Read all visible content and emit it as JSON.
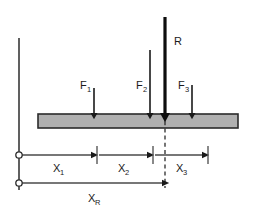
{
  "diagram": {
    "colors": {
      "beam_fill": "#b0b0b0",
      "beam_stroke": "#2b2b2b",
      "line": "#4a4a4a",
      "arrow": "#1a1a1a",
      "resultant": "#0d0d0d",
      "dashed": "#2b2b2b",
      "text": "#1a1a1a",
      "background": "#ffffff"
    },
    "forces": [
      {
        "id": "f1",
        "label": "F",
        "subscript": "1",
        "x": 94,
        "arrow_top": 88,
        "arrow_bottom": 114,
        "label_x": 80,
        "label_y": 89,
        "width": 1.6
      },
      {
        "id": "f2",
        "label": "F",
        "subscript": "2",
        "x": 150,
        "arrow_top": 50,
        "arrow_bottom": 114,
        "label_x": 136,
        "label_y": 89,
        "width": 1.6
      },
      {
        "id": "f3",
        "label": "F",
        "subscript": "3",
        "x": 192,
        "arrow_top": 85,
        "arrow_bottom": 114,
        "label_x": 178,
        "label_y": 89,
        "width": 1.6
      }
    ],
    "resultant": {
      "id": "r",
      "label": "R",
      "subscript": "",
      "x": 165,
      "arrow_top": 17,
      "arrow_bottom": 114,
      "label_x": 174,
      "label_y": 45,
      "width": 3.2
    },
    "beam": {
      "x": 38,
      "y": 114,
      "width": 200,
      "height": 14
    },
    "datum_line": {
      "x": 19,
      "y_top": 38,
      "y_bottom": 190
    },
    "dashed_line": {
      "x": 165,
      "y_top": 114,
      "y_bottom": 188
    },
    "dimensions": [
      {
        "id": "x1",
        "label": "X",
        "subscript": "1",
        "y": 155,
        "x_start": 19,
        "x_end": 94,
        "label_x": 53,
        "label_y": 172,
        "tick": true
      },
      {
        "id": "x2",
        "label": "X",
        "subscript": "2",
        "y": 155,
        "x_start": 94,
        "x_end": 150,
        "label_x": 118,
        "label_y": 172,
        "tick": true
      },
      {
        "id": "x3",
        "label": "X",
        "subscript": "3",
        "y": 155,
        "x_start": 150,
        "x_end": 205,
        "label_x": 176,
        "label_y": 172,
        "tick": true
      },
      {
        "id": "xr",
        "label": "X",
        "subscript": "R",
        "y": 183,
        "x_start": 19,
        "x_end": 165,
        "label_x": 88,
        "label_y": 202,
        "tick": false
      }
    ],
    "origin_markers": [
      {
        "id": "origin-upper",
        "cx": 19,
        "cy": 155,
        "r": 3.2
      },
      {
        "id": "origin-lower",
        "cx": 19,
        "cy": 183,
        "r": 3.2
      }
    ]
  }
}
